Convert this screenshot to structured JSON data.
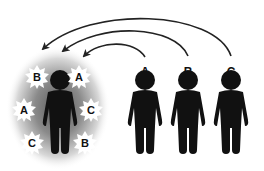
{
  "diagram": {
    "center_person": {
      "bursts": [
        {
          "label": "B",
          "x": 37,
          "y": 77
        },
        {
          "label": "A",
          "x": 79,
          "y": 77
        },
        {
          "label": "A",
          "x": 24,
          "y": 110
        },
        {
          "label": "C",
          "x": 91,
          "y": 110
        },
        {
          "label": "C",
          "x": 32,
          "y": 143
        },
        {
          "label": "B",
          "x": 85,
          "y": 143
        }
      ]
    },
    "people": [
      {
        "label": "A",
        "x": 145
      },
      {
        "label": "B",
        "x": 188
      },
      {
        "label": "C",
        "x": 231
      }
    ],
    "colors": {
      "figure": "#111111",
      "glow": "#6b6b6b",
      "arrow": "#222222",
      "burst": "#ffffff"
    }
  }
}
